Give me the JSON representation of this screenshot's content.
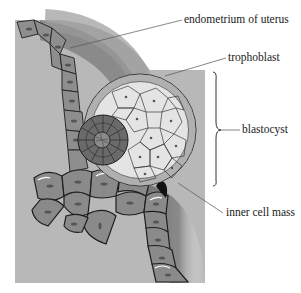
{
  "diagram": {
    "labels": {
      "endometrium": "endometrium of uterus",
      "trophoblast": "trophoblast",
      "blastocyst": "blastocyst",
      "inner_cell_mass": "inner cell mass"
    },
    "colors": {
      "uterine_lumen": "#b4b4b4",
      "endometrium_shadow": "#7a7a7a",
      "epithelial_cell": "#8e8e8e",
      "cell_outline": "#2a2a2a",
      "nucleus": "#555555",
      "trophoblast_fill": "#e6e6e6",
      "inner_cell_mass": "#6a6a6a",
      "leader_line": "#555555"
    }
  }
}
